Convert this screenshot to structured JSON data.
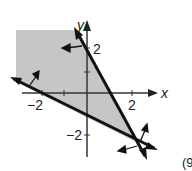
{
  "graph": {
    "x_axis_label": "x",
    "y_axis_label": "y",
    "tick_labels": {
      "x_neg2": "−2",
      "x_pos2": "2",
      "y_pos2": "2",
      "y_neg2": "−2"
    },
    "shade_color": "#c8c8c8",
    "line_color": "#1a1a1a",
    "lines": [
      {
        "name": "steep boundary",
        "description": "line through (0,2) with negative slope about -2"
      },
      {
        "name": "shallow boundary",
        "description": "line through (0,-1) with slope about -1/2"
      }
    ],
    "region": "shaded region above shallow line and left of steep line"
  },
  "exercise_label": "(9"
}
